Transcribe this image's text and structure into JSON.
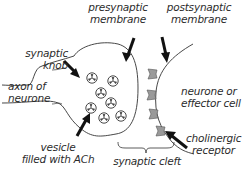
{
  "diagram": {
    "labels": {
      "presynaptic_membrane": [
        "presynaptic",
        "membrane"
      ],
      "postsynaptic_membrane": [
        "postsynaptic",
        "membrane"
      ],
      "synaptic_knob": [
        "synaptic",
        "knob"
      ],
      "axon_of_neurone": [
        "axon of",
        "neurone"
      ],
      "neurone_or_effector_cell": [
        "neurone or",
        "effector cell"
      ],
      "vesicle": [
        "vesicle",
        "filled with ACh"
      ],
      "cholinergic_receptor": [
        "cholinergic",
        "receptor"
      ],
      "synaptic_cleft": "synaptic cleft"
    },
    "counts": {
      "vesicles": 7,
      "receptors": 4
    },
    "colors": {
      "line": "#333333",
      "arrow": "#111111",
      "receptor_fill": "#9a9a9a",
      "text": "#2b2b2b"
    }
  }
}
